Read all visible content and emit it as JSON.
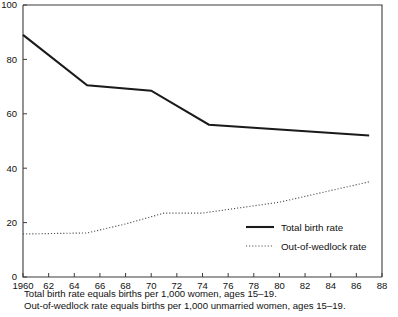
{
  "chart_data": {
    "type": "line",
    "title": "",
    "subtitle": "",
    "xlabel": "",
    "ylabel": "",
    "xlim": [
      1960,
      1988
    ],
    "ylim": [
      0,
      100
    ],
    "grid": false,
    "legend_position": "inside-lower-right",
    "x_ticks": [
      "1960",
      "62",
      "64",
      "66",
      "68",
      "70",
      "72",
      "74",
      "76",
      "78",
      "80",
      "82",
      "84",
      "86",
      "88"
    ],
    "x_tick_values": [
      1960,
      1962,
      1964,
      1966,
      1968,
      1970,
      1972,
      1974,
      1976,
      1978,
      1980,
      1982,
      1984,
      1986,
      1988
    ],
    "y_ticks": [
      "0",
      "20",
      "40",
      "60",
      "80",
      "100"
    ],
    "y_tick_values": [
      0,
      20,
      40,
      60,
      80,
      100
    ],
    "series": [
      {
        "name": "Total birth rate",
        "style": "solid",
        "color": "#1a1a1a",
        "x": [
          1960,
          1965,
          1970,
          1974.5,
          1987
        ],
        "values": [
          89,
          70.5,
          68.5,
          56,
          52
        ]
      },
      {
        "name": "Out-of-wedlock rate",
        "style": "dotted",
        "color": "#4a4a4a",
        "x": [
          1960,
          1965,
          1968,
          1971,
          1974,
          1980,
          1987
        ],
        "values": [
          15.8,
          16.2,
          19.5,
          23.5,
          23.5,
          27.5,
          35
        ]
      }
    ],
    "annotations": [
      "Total birth rate equals births per 1,000 women, ages 15–19.",
      "Out-of-wedlock rate equals births per 1,000 unmarried women, ages 15–19."
    ]
  },
  "legend": {
    "items": [
      {
        "label": "Total birth rate",
        "style": "solid"
      },
      {
        "label": "Out-of-wedlock rate",
        "style": "dotted"
      }
    ]
  },
  "captions": {
    "line1": "Total birth rate equals births per 1,000 women, ages 15–19.",
    "line2": "Out-of-wedlock rate equals births per 1,000 unmarried women, ages 15–19."
  }
}
